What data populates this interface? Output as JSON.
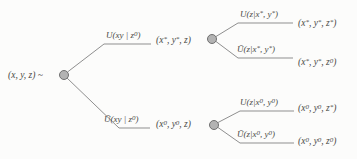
{
  "colors": {
    "bg": "#fcfcfb",
    "line": "#8f8f8f",
    "node-fill": "#b3b3b3",
    "node-stroke": "#707070",
    "text": "#4a4a46"
  },
  "tree": {
    "root": {
      "label": "(x, y, z) ~"
    },
    "level1": [
      {
        "branch_label": "U(xy | z^0)",
        "node_label": "(x^*, y^*, z)"
      },
      {
        "branch_label": "Ū(xy | z^0)",
        "node_label": "(x^0, y^0, z)"
      }
    ],
    "level2": [
      {
        "branch_label": "U(z|x^*, y^*)",
        "outcome": "(x^*, y^*, z^*)"
      },
      {
        "branch_label": "Ū(z|x^*, y^*)",
        "outcome": "(x^*, y^*, z^0)"
      },
      {
        "branch_label": "U(z|x^0, y^0)",
        "outcome": "(x^0, y^0, z^*)"
      },
      {
        "branch_label": "Ū(z|x^0, y^0)",
        "outcome": "(x^0, y^0, z^0)"
      }
    ]
  }
}
